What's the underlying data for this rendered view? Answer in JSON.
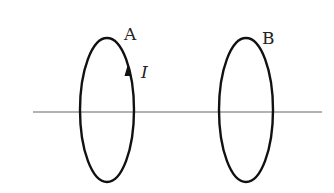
{
  "diagram": {
    "title": "",
    "axis": {
      "x1": 33,
      "x2": 322,
      "y": 112,
      "color": "#999999"
    },
    "loops": [
      {
        "id": "A",
        "label": "A",
        "cx": 107,
        "cy": 110,
        "rx": 27,
        "ry": 72,
        "stroke": "#111111",
        "label_x": 124,
        "label_y": 26
      },
      {
        "id": "B",
        "label": "B",
        "cx": 246,
        "cy": 110,
        "rx": 27,
        "ry": 72,
        "stroke": "#111111",
        "label_x": 262,
        "label_y": 30
      }
    ],
    "current": {
      "label": "I",
      "loop": "A",
      "direction": "up",
      "label_x": 141,
      "label_y": 64
    }
  }
}
